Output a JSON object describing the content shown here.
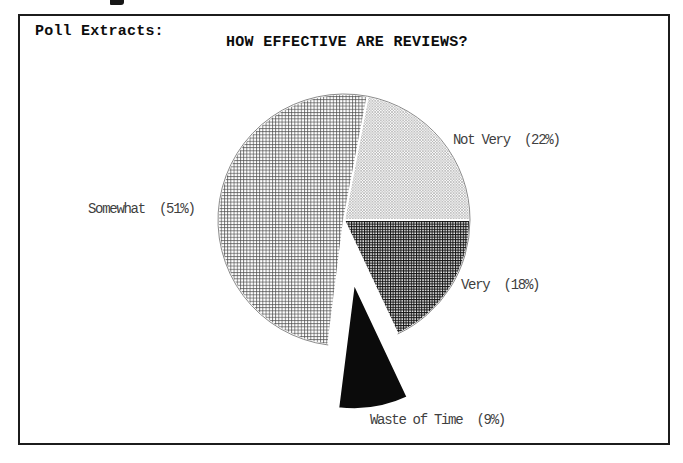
{
  "page": {
    "frame_label": "Poll Extracts:"
  },
  "chart_data": {
    "type": "pie",
    "title": "HOW EFFECTIVE ARE REVIEWS?",
    "unit": "percent",
    "start_angle_deg": 79.2,
    "direction": "clockwise",
    "legend_position": "labels-beside-slices",
    "slices": [
      {
        "label": "Not Very",
        "value": 22,
        "display": "Not Very  (22%)",
        "pattern": "diagonal-hatch-light",
        "exploded": false
      },
      {
        "label": "Very",
        "value": 18,
        "display": "Very  (18%)",
        "pattern": "grid-dark",
        "exploded": false
      },
      {
        "label": "Waste of Time",
        "value": 9,
        "display": "Waste of Time  (9%)",
        "pattern": "solid-black",
        "exploded": true
      },
      {
        "label": "Somewhat",
        "value": 51,
        "display": "Somewhat  (51%)",
        "pattern": "grid-light",
        "exploded": false
      }
    ]
  },
  "colors": {
    "frame_border": "#1c1c1c",
    "title_text": "#0d0d0d",
    "label_text": "#3f3f3f",
    "slice_solid_black": "#0b0b0b",
    "hatch_light_stroke": "#8a8a8a",
    "grid_light_stroke": "#4a4a4a",
    "grid_dark_stroke": "#141414",
    "pie_rim": "#8a8a8a"
  }
}
